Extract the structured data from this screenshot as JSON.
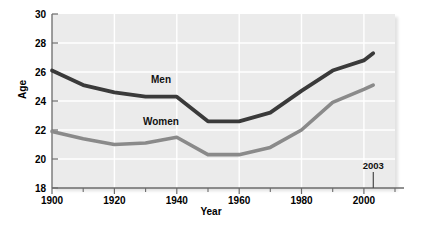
{
  "chart_data": {
    "type": "line",
    "title": "",
    "xlabel": "Year",
    "ylabel": "Age",
    "xlim": [
      1900,
      2010
    ],
    "ylim": [
      18,
      30
    ],
    "xticks": [
      1900,
      1920,
      1940,
      1960,
      1980,
      2000
    ],
    "xticklabels": [
      "1900",
      "1920",
      "1940",
      "1960",
      "1980",
      "2000"
    ],
    "xminorticks": [
      1910,
      1930,
      1950,
      1970,
      1990
    ],
    "yticks": [
      18,
      20,
      22,
      24,
      26,
      28,
      30
    ],
    "yticklabels": [
      "18",
      "20",
      "22",
      "24",
      "26",
      "28",
      "30"
    ],
    "grid": true,
    "legend_position": "inline-labels",
    "x": [
      1900,
      1910,
      1920,
      1930,
      1940,
      1950,
      1960,
      1970,
      1980,
      1990,
      2000,
      2003
    ],
    "series": [
      {
        "name": "Men",
        "color": "#3a3a3a",
        "values": [
          26.1,
          25.1,
          24.6,
          24.3,
          24.3,
          22.6,
          22.6,
          23.2,
          24.7,
          26.1,
          26.8,
          27.3
        ]
      },
      {
        "name": "Women",
        "color": "#8a8a8a",
        "values": [
          21.9,
          21.4,
          21.0,
          21.1,
          21.5,
          20.3,
          20.3,
          20.8,
          22.0,
          23.9,
          24.8,
          25.1
        ]
      }
    ],
    "annotations": [
      {
        "text": "2003",
        "x": 2003,
        "y": 19.1,
        "kind": "callout-with-leader"
      }
    ]
  },
  "labels": {
    "men": "Men",
    "women": "Women",
    "annotation_2003": "2003",
    "axis_y": "Age",
    "axis_x": "Year"
  },
  "colors": {
    "plot_background": "#ebebeb",
    "gridline": "#ffffff",
    "axis": "#6b6b6b",
    "men_line": "#3a3a3a",
    "women_line": "#8a8a8a",
    "text": "#000000"
  }
}
